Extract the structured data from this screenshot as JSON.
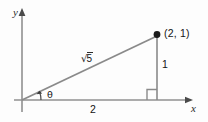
{
  "figure": {
    "type": "geometry-diagram",
    "background_color": "#fdfdfd",
    "line_color": "#808080",
    "text_color": "#141414",
    "axes": {
      "x_label": "x",
      "y_label": "y",
      "origin": [
        22,
        100
      ],
      "x_axis_from": [
        14,
        100
      ],
      "x_axis_to": [
        192,
        100
      ],
      "y_axis_from": [
        22,
        112
      ],
      "y_axis_to": [
        22,
        10
      ]
    },
    "point": {
      "label": "(2, 1)",
      "coordinates": [
        2,
        1
      ],
      "pixel": [
        157,
        35
      ]
    },
    "labels": {
      "hypotenuse_radicand": "5",
      "hypotenuse_radical_sign": "√",
      "opposite_side": "1",
      "adjacent_side": "2",
      "angle": "θ"
    },
    "right_angle_marker": {
      "name": "right-angle-square",
      "pixel": [
        148,
        89
      ],
      "size": 11
    }
  }
}
